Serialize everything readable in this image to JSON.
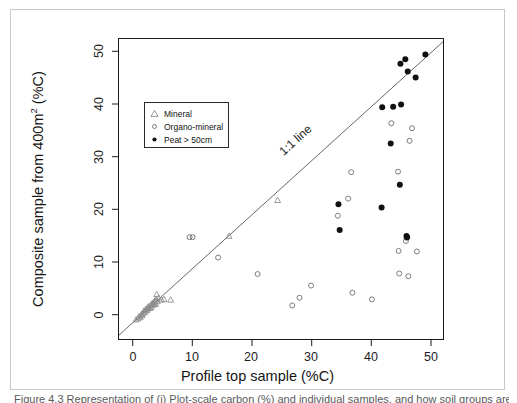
{
  "figure": {
    "caption": "Figure 4.3  Representation of (i) Plot-scale carbon (%) and individual samples, and how soil groups are...",
    "line_label": "1:1 line"
  },
  "axes": {
    "x_title": "Profile top sample (%C)",
    "y_title_pre": "Composite sample from 400m",
    "y_title_sup": "2",
    "y_title_post": " (%C)",
    "x_ticks": [
      "0",
      "10",
      "20",
      "30",
      "40",
      "50"
    ],
    "y_ticks": [
      "0",
      "10",
      "20",
      "30",
      "40",
      "50"
    ],
    "x_values": [
      0,
      10,
      20,
      30,
      40,
      50
    ],
    "y_values": [
      0,
      10,
      20,
      30,
      40,
      50
    ]
  },
  "legend": {
    "entries": [
      {
        "label": "Mineral",
        "marker": "triangle-open",
        "color": "#808080"
      },
      {
        "label": "Organo-mineral",
        "marker": "circle-open",
        "color": "#808080"
      },
      {
        "label": "Peat > 50cm",
        "marker": "circle-filled",
        "color": "#111111"
      }
    ]
  },
  "chart_data": {
    "type": "scatter",
    "title": "",
    "xlabel": "Profile top sample (%C)",
    "ylabel": "Composite sample from 400m2 (%C)",
    "xlim": [
      -1.8,
      51.5
    ],
    "ylim": [
      -2.5,
      52.0
    ],
    "grid": false,
    "legend_position": "upper-left-inside",
    "reference_line": {
      "label": "1:1 line",
      "slope": 1,
      "intercept": 0,
      "color": "#555555"
    },
    "series": [
      {
        "name": "Mineral",
        "marker": "triangle-open",
        "color": "#8a8a8a",
        "points": [
          [
            1.0,
            1.0
          ],
          [
            1.3,
            1.2
          ],
          [
            1.5,
            1.6
          ],
          [
            1.7,
            1.4
          ],
          [
            1.9,
            2.0
          ],
          [
            2.0,
            1.8
          ],
          [
            2.2,
            2.2
          ],
          [
            2.3,
            2.6
          ],
          [
            2.5,
            2.4
          ],
          [
            2.6,
            2.9
          ],
          [
            2.8,
            2.7
          ],
          [
            2.9,
            3.2
          ],
          [
            3.0,
            3.0
          ],
          [
            3.1,
            3.4
          ],
          [
            3.3,
            3.1
          ],
          [
            3.4,
            3.6
          ],
          [
            3.5,
            3.3
          ],
          [
            3.6,
            3.9
          ],
          [
            3.8,
            3.7
          ],
          [
            3.9,
            4.2
          ],
          [
            4.0,
            4.0
          ],
          [
            4.1,
            4.4
          ],
          [
            4.2,
            3.8
          ],
          [
            4.3,
            4.7
          ],
          [
            4.4,
            5.6
          ],
          [
            4.5,
            4.3
          ],
          [
            4.7,
            5.0
          ],
          [
            5.2,
            4.6
          ],
          [
            5.6,
            4.7
          ],
          [
            6.7,
            4.6
          ],
          [
            16.3,
            16.2
          ],
          [
            24.3,
            22.7
          ]
        ]
      },
      {
        "name": "Organo-mineral",
        "marker": "circle-open",
        "color": "#6e6e6e",
        "points": [
          [
            9.8,
            16.0
          ],
          [
            10.3,
            16.0
          ],
          [
            14.5,
            12.3
          ],
          [
            21.0,
            9.3
          ],
          [
            26.7,
            3.6
          ],
          [
            27.9,
            5.0
          ],
          [
            29.8,
            7.2
          ],
          [
            34.2,
            19.9
          ],
          [
            35.9,
            23.0
          ],
          [
            36.4,
            27.8
          ],
          [
            36.6,
            5.9
          ],
          [
            39.8,
            4.7
          ],
          [
            43.0,
            36.7
          ],
          [
            44.1,
            27.9
          ],
          [
            44.2,
            13.5
          ],
          [
            44.3,
            9.4
          ],
          [
            45.4,
            15.3
          ],
          [
            45.5,
            15.9
          ],
          [
            45.8,
            8.9
          ],
          [
            46.0,
            33.5
          ],
          [
            46.4,
            35.8
          ],
          [
            47.2,
            13.4
          ]
        ]
      },
      {
        "name": "Peat > 50cm",
        "marker": "circle-filled",
        "color": "#111111",
        "points": [
          [
            34.3,
            22.0
          ],
          [
            34.5,
            17.3
          ],
          [
            41.4,
            21.4
          ],
          [
            41.5,
            39.6
          ],
          [
            42.9,
            33.0
          ],
          [
            43.3,
            39.7
          ],
          [
            44.4,
            25.5
          ],
          [
            44.5,
            47.5
          ],
          [
            44.6,
            40.1
          ],
          [
            45.3,
            48.3
          ],
          [
            45.5,
            16.2
          ],
          [
            45.6,
            16.0
          ],
          [
            45.7,
            46.1
          ],
          [
            47.0,
            45.0
          ],
          [
            48.6,
            49.2
          ]
        ]
      }
    ]
  }
}
